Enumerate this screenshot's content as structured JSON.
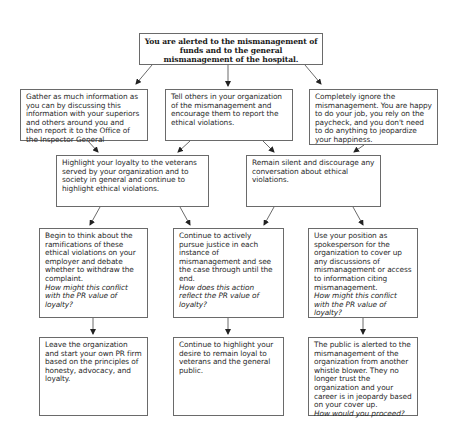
{
  "diagram": {
    "type": "flowchart",
    "root": {
      "id": "root",
      "text": "You are alerted to the mismanagement of funds and to the general mismanagement of the hospital."
    },
    "level1": [
      {
        "id": "gather",
        "text": "Gather as much information as you can by discussing this information with your superiors and others around you and then report it to the Office of the Inspector General"
      },
      {
        "id": "tell",
        "text": "Tell others in your organization of the mismanagement and encourage them to report the ethical violations."
      },
      {
        "id": "ignore",
        "text": "Completely ignore the mismanagement. You are happy to do your job, you rely on the paycheck, and you don't need to do anything to jeopardize your happiness."
      }
    ],
    "level2": [
      {
        "id": "highlight",
        "text": "Highlight your loyalty to the veterans served by your organization and to society in general and continue to highlight ethical violations."
      },
      {
        "id": "silent",
        "text": "Remain silent and discourage any conversation about ethical violations."
      }
    ],
    "level3": [
      {
        "id": "begin",
        "text": "Begin to think about the ramifications of these ethical violations on your employer and debate whether to withdraw the complaint.",
        "question": "How might this conflict with the PR value of loyalty?"
      },
      {
        "id": "pursue",
        "text": "Continue to actively pursue justice in each instance of mismanagement and see the case through until the end.",
        "question": "How does this action reflect the PR value of loyalty?"
      },
      {
        "id": "coverup",
        "text": "Use your position as spokesperson for the organization to cover up any discussions of mismanagement or access to information citing mismanagement.",
        "question": "How might this conflict with the PR value of loyalty?"
      }
    ],
    "level4": [
      {
        "id": "leave",
        "text": "Leave the organization and start your own PR firm based on the principles of honesty, advocacy, and loyalty."
      },
      {
        "id": "continue",
        "text": "Continue to highlight your desire to remain loyal to veterans and the general public."
      },
      {
        "id": "public",
        "text": "The public is alerted to the mismanagement of the organization from another whistle blower. They no longer trust the organization and your career is in jeopardy based on your cover up.",
        "question": "How would you proceed?"
      }
    ],
    "edges": [
      [
        "root",
        "gather"
      ],
      [
        "root",
        "tell"
      ],
      [
        "root",
        "ignore"
      ],
      [
        "gather",
        "highlight"
      ],
      [
        "tell",
        "highlight"
      ],
      [
        "tell",
        "silent"
      ],
      [
        "ignore",
        "silent"
      ],
      [
        "highlight",
        "begin"
      ],
      [
        "highlight",
        "pursue"
      ],
      [
        "silent",
        "pursue"
      ],
      [
        "silent",
        "coverup"
      ],
      [
        "begin",
        "leave"
      ],
      [
        "pursue",
        "continue"
      ],
      [
        "coverup",
        "public"
      ]
    ]
  },
  "colors": {
    "border": "#6a6a6a",
    "arrow": "#333333",
    "text": "#2a2a2a",
    "background": "#ffffff"
  }
}
